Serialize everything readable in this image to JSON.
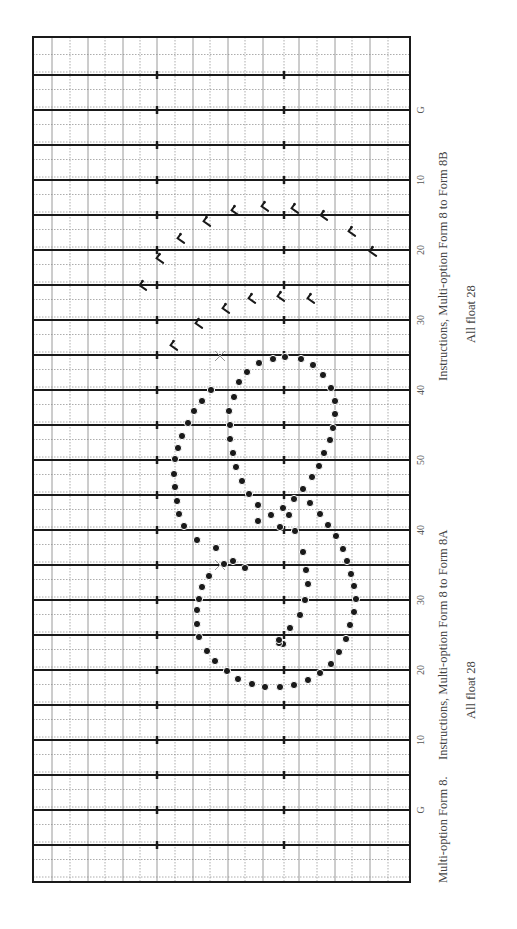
{
  "figure": {
    "field": {
      "left": 33,
      "right": 410,
      "top": 37,
      "bottom": 882
    },
    "colors": {
      "ink": "#1a1a1a",
      "grid": "#9a9a9a",
      "dotted": "#8a8a8a",
      "cross": "#999999",
      "background": "#ffffff"
    },
    "yard_lines": [
      {
        "y": 75,
        "label": ""
      },
      {
        "y": 110,
        "label": "G"
      },
      {
        "y": 145,
        "label": ""
      },
      {
        "y": 180,
        "label": "10"
      },
      {
        "y": 215,
        "label": ""
      },
      {
        "y": 250,
        "label": "20"
      },
      {
        "y": 285,
        "label": ""
      },
      {
        "y": 320,
        "label": "30"
      },
      {
        "y": 355,
        "label": ""
      },
      {
        "y": 390,
        "label": "40"
      },
      {
        "y": 425,
        "label": ""
      },
      {
        "y": 460,
        "label": "50"
      },
      {
        "y": 495,
        "label": ""
      },
      {
        "y": 530,
        "label": "40"
      },
      {
        "y": 565,
        "label": ""
      },
      {
        "y": 600,
        "label": "30"
      },
      {
        "y": 635,
        "label": ""
      },
      {
        "y": 670,
        "label": "20"
      },
      {
        "y": 705,
        "label": ""
      },
      {
        "y": 740,
        "label": "10"
      },
      {
        "y": 775,
        "label": ""
      },
      {
        "y": 810,
        "label": "G"
      },
      {
        "y": 845,
        "label": ""
      }
    ],
    "hash_x": [
      157,
      284
    ],
    "grid_x": [
      52,
      70,
      88,
      105,
      123,
      140,
      157,
      175,
      193,
      210,
      228,
      245,
      263,
      284,
      299,
      317,
      335,
      352,
      370,
      388
    ],
    "label_x": 420
  },
  "texts": {
    "form8b_title": "Instructions, Multi-option Form 8 to Form 8B",
    "form8b_float": "All float 28",
    "form8a_title": "Instructions, Multi-option Form 8 to Form 8A",
    "form8a_float": "All float 28",
    "form8_title": "Multi-option Form 8."
  },
  "chart_data": {
    "type": "scatter",
    "title": "Multi-option Form 8.",
    "xlabel": "Field width (sideline to sideline)",
    "ylabel": "Yard line",
    "yard_line_labels": [
      "G",
      "10",
      "20",
      "30",
      "40",
      "50",
      "40",
      "30",
      "20",
      "10",
      "G"
    ],
    "annotations": [
      "Instructions, Multi-option Form 8 to Form 8B — All float 28",
      "Instructions, Multi-option Form 8 to Form 8A — All float 28"
    ],
    "series": [
      {
        "name": "Form 8 performers (dots)",
        "marker": "filled-circle",
        "points": [
          [
            285,
            357
          ],
          [
            273,
            359
          ],
          [
            301,
            359
          ],
          [
            259,
            363
          ],
          [
            313,
            365
          ],
          [
            247,
            372
          ],
          [
            323,
            375
          ],
          [
            239,
            382
          ],
          [
            331,
            388
          ],
          [
            211,
            390
          ],
          [
            234,
            397
          ],
          [
            335,
            401
          ],
          [
            202,
            401
          ],
          [
            194,
            411
          ],
          [
            229,
            411
          ],
          [
            335,
            414
          ],
          [
            188,
            423
          ],
          [
            230,
            425
          ],
          [
            333,
            428
          ],
          [
            182,
            436
          ],
          [
            230,
            439
          ],
          [
            330,
            440
          ],
          [
            178,
            448
          ],
          [
            233,
            453
          ],
          [
            324,
            453
          ],
          [
            175,
            459
          ],
          [
            236,
            467
          ],
          [
            319,
            466
          ],
          [
            174,
            474
          ],
          [
            242,
            481
          ],
          [
            312,
            477
          ],
          [
            175,
            487
          ],
          [
            249,
            494
          ],
          [
            303,
            489
          ],
          [
            177,
            501
          ],
          [
            258,
            505
          ],
          [
            294,
            499
          ],
          [
            179,
            514
          ],
          [
            271,
            515
          ],
          [
            283,
            508
          ],
          [
            310,
            503
          ],
          [
            184,
            526
          ],
          [
            280,
            527
          ],
          [
            258,
            521
          ],
          [
            320,
            514
          ],
          [
            328,
            525
          ],
          [
            197,
            540
          ],
          [
            216,
            548
          ],
          [
            233,
            561
          ],
          [
            245,
            568
          ],
          [
            224,
            564
          ],
          [
            209,
            576
          ],
          [
            202,
            587
          ],
          [
            199,
            599
          ],
          [
            197,
            610
          ],
          [
            197,
            624
          ],
          [
            199,
            637
          ],
          [
            207,
            651
          ],
          [
            215,
            661
          ],
          [
            227,
            671
          ],
          [
            238,
            679
          ],
          [
            252,
            684
          ],
          [
            265,
            687
          ],
          [
            280,
            687
          ],
          [
            294,
            685
          ],
          [
            308,
            680
          ],
          [
            320,
            673
          ],
          [
            331,
            664
          ],
          [
            339,
            652
          ],
          [
            346,
            639
          ],
          [
            350,
            625
          ],
          [
            354,
            612
          ],
          [
            356,
            599
          ],
          [
            354,
            586
          ],
          [
            351,
            574
          ],
          [
            347,
            561
          ],
          [
            343,
            549
          ],
          [
            336,
            536
          ],
          [
            289,
            515
          ],
          [
            295,
            531
          ],
          [
            303,
            552
          ],
          [
            306,
            570
          ],
          [
            308,
            584
          ],
          [
            305,
            600
          ],
          [
            300,
            615
          ],
          [
            290,
            628
          ],
          [
            283,
            644
          ],
          [
            279,
            643
          ],
          [
            279,
            640
          ]
        ]
      },
      {
        "name": "Form 8B path markers (footstep arrows)",
        "marker": "flag-arrow",
        "points": [
          [
            236,
            211
          ],
          [
            266,
            207
          ],
          [
            296,
            209
          ],
          [
            325,
            216
          ],
          [
            353,
            232
          ],
          [
            374,
            252
          ],
          [
            208,
            222
          ],
          [
            182,
            239
          ],
          [
            161,
            259
          ],
          [
            144,
            286
          ],
          [
            175,
            346
          ],
          [
            200,
            324
          ],
          [
            227,
            309
          ],
          [
            253,
            299
          ],
          [
            282,
            297
          ],
          [
            312,
            299
          ]
        ]
      },
      {
        "name": "Reference crosses",
        "marker": "x",
        "points": [
          [
            220,
            356
          ],
          [
            220,
            565
          ]
        ]
      }
    ]
  }
}
